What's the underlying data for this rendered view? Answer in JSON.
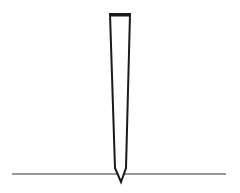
{
  "diagram": {
    "colors": {
      "background": "#ffffff",
      "stroke": "#1a1a1a",
      "ground": "#333333"
    },
    "stake": {
      "top_left": [
        110,
        14
      ],
      "top_right": [
        130,
        14
      ],
      "bottom_left": [
        115,
        168
      ],
      "bottom_right": [
        126,
        168
      ],
      "tip": [
        121,
        182
      ]
    },
    "ground_line": {
      "x1": 12,
      "y1": 174,
      "x2": 226,
      "y2": 174
    }
  }
}
